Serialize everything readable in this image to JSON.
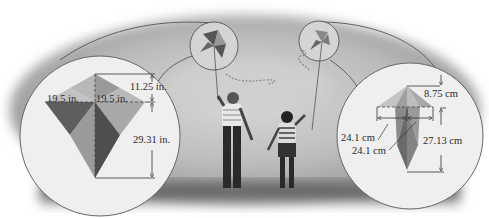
{
  "figure": {
    "left_kite": {
      "labels": {
        "half_width_left": "19.5 in.",
        "half_width_right": "19.5 in.",
        "top_height": "11.25 in.",
        "bottom_height": "29.31 in."
      },
      "colors": {
        "dark": "#5e5e5e",
        "mid": "#8c8c8c",
        "light": "#b4b4b4"
      }
    },
    "right_kite": {
      "labels": {
        "top_height": "8.75 cm",
        "half_width_left": "24.1 cm",
        "half_width_right": "24.1 cm",
        "bottom_height": "27.13 cm"
      },
      "colors": {
        "dark": "#6a6a6a",
        "mid": "#939393",
        "light": "#bdbdbd"
      }
    },
    "colors": {
      "sky_light": "#e4e4e4",
      "sky_dark": "#9a9a9a",
      "ground": "#6b6b6b",
      "inset_fill": "#efefef",
      "outline": "#555555",
      "dimension_line": "#333333"
    }
  }
}
